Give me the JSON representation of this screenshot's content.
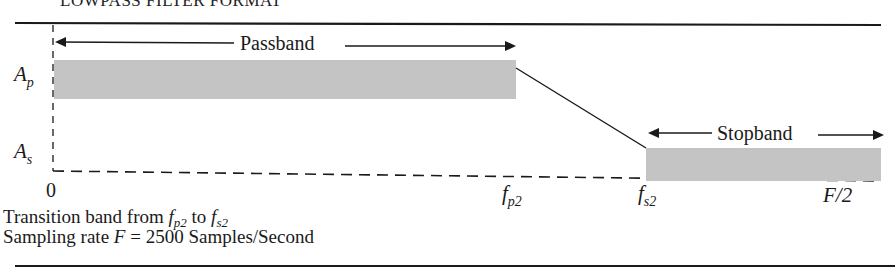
{
  "figure": {
    "header_partial": "LOWPASS FILTER FORMAT",
    "axis": {
      "y_labels": [
        {
          "main": "A",
          "sub": "p"
        },
        {
          "main": "A",
          "sub": "s"
        }
      ],
      "x_labels": [
        {
          "main": "0",
          "sub": ""
        },
        {
          "main": "f",
          "sub": "p2"
        },
        {
          "main": "f",
          "sub": "s2"
        },
        {
          "main": "F/2",
          "sub": ""
        }
      ]
    },
    "bands": {
      "passband_label": "Passband",
      "stopband_label": "Stopband"
    },
    "caption": {
      "line1_prefix": "Transition band from ",
      "line1_f1": "f",
      "line1_f1_sub": "p2",
      "line1_mid": " to ",
      "line1_f2": "f",
      "line1_f2_sub": "s2",
      "line2_prefix": "Sampling rate ",
      "line2_var": "F",
      "line2_value": " = 2500 Samples/Second"
    },
    "colors": {
      "band_fill": "#c4c4c4",
      "line": "#1a1a1a"
    }
  }
}
